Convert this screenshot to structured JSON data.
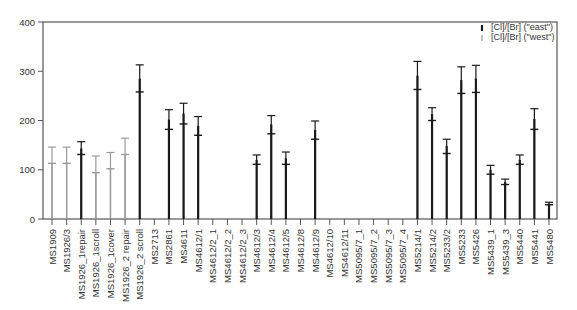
{
  "chart_data": {
    "type": "errorbar",
    "title": "",
    "xlabel": "",
    "ylabel": "",
    "ylim": [
      0,
      400
    ],
    "yticks": [
      0,
      100,
      200,
      300,
      400
    ],
    "grid": false,
    "legend_position": "top-right",
    "legend": [
      {
        "label": "[Cl]/[Br] (\"east\")",
        "color": "#1a1a1a"
      },
      {
        "label": "[Cl]/[Br] (\"west\")",
        "color": "#9a9a9a"
      }
    ],
    "categories": [
      "MS1909",
      "MS1926/3",
      "MS1926_1repair",
      "MS1926_1scroll",
      "MS1926_1cover",
      "MS1926_2 repair",
      "MS1926_2 scroll",
      "MS2713",
      "MS2861",
      "MS4611",
      "MS4612/1",
      "MS4612/2_1",
      "MS4612/2_2",
      "MS4612/2_3",
      "MS4612/3",
      "MS4612/4",
      "MS4612/5",
      "MS4612/8",
      "MS4612/9",
      "MS4612/10",
      "MS4612/11",
      "MS5095/7_1",
      "MS5095/7_2",
      "MS5095/7_3",
      "MS5095/7_4",
      "MS5214/1",
      "MS5214/2",
      "MS5233/2",
      "MS5233",
      "MS5426",
      "MS5439_1",
      "MS5439_3",
      "MS5440",
      "MS5441",
      "MS5480"
    ],
    "series": [
      {
        "name": "[Cl]/[Br] (\"east\")",
        "points": [
          {
            "category": "MS1926_1repair",
            "value": 131,
            "upper": 157,
            "thick_top": 143
          },
          {
            "category": "MS1926_2 scroll",
            "value": 258,
            "upper": 313,
            "thick_top": 285
          },
          {
            "category": "MS2861",
            "value": 182,
            "upper": 222,
            "thick_top": 202
          },
          {
            "category": "MS4611",
            "value": 193,
            "upper": 235,
            "thick_top": 214
          },
          {
            "category": "MS4612/1",
            "value": 170,
            "upper": 208,
            "thick_top": 189
          },
          {
            "category": "MS4612/3",
            "value": 111,
            "upper": 130,
            "thick_top": 120
          },
          {
            "category": "MS4612/4",
            "value": 173,
            "upper": 210,
            "thick_top": 192
          },
          {
            "category": "MS4612/5",
            "value": 111,
            "upper": 136,
            "thick_top": 123
          },
          {
            "category": "MS4612/9",
            "value": 162,
            "upper": 199,
            "thick_top": 181
          },
          {
            "category": "MS5214/1",
            "value": 263,
            "upper": 320,
            "thick_top": 291
          },
          {
            "category": "MS5214/2",
            "value": 200,
            "upper": 226,
            "thick_top": 213
          },
          {
            "category": "MS5233/2",
            "value": 133,
            "upper": 162,
            "thick_top": 148
          },
          {
            "category": "MS5233",
            "value": 255,
            "upper": 309,
            "thick_top": 282
          },
          {
            "category": "MS5426",
            "value": 257,
            "upper": 312,
            "thick_top": 285
          },
          {
            "category": "MS5439_1",
            "value": 91,
            "upper": 109,
            "thick_top": 100
          },
          {
            "category": "MS5439_3",
            "value": 70,
            "upper": 81,
            "thick_top": 75
          },
          {
            "category": "MS5440",
            "value": 111,
            "upper": 130,
            "thick_top": 120
          },
          {
            "category": "MS5441",
            "value": 182,
            "upper": 224,
            "thick_top": 203
          },
          {
            "category": "MS5480",
            "value": 29,
            "upper": 34,
            "thick_top": 31
          }
        ]
      },
      {
        "name": "[Cl]/[Br] (\"west\")",
        "points": [
          {
            "category": "MS1909",
            "value": 113,
            "upper": 146,
            "thick_top": 113
          },
          {
            "category": "MS1926/3",
            "value": 113,
            "upper": 146,
            "thick_top": 113
          },
          {
            "category": "MS1926_1scroll",
            "value": 94,
            "upper": 128,
            "thick_top": 94
          },
          {
            "category": "MS1926_1cover",
            "value": 102,
            "upper": 135,
            "thick_top": 102
          },
          {
            "category": "MS1926_2 repair",
            "value": 131,
            "upper": 164,
            "thick_top": 131
          }
        ]
      }
    ]
  }
}
